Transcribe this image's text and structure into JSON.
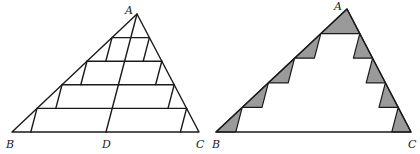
{
  "figure_left": {
    "labels": {
      "A": "A",
      "B": "B",
      "C": "C",
      "D": "D"
    },
    "vertices": {
      "A": [
        137,
        14
      ],
      "B": [
        12,
        132
      ],
      "C": [
        199,
        132
      ],
      "D": [
        106,
        132
      ]
    },
    "strip_count": 5
  },
  "figure_right": {
    "labels": {
      "A": "A",
      "B": "B",
      "C": "C"
    },
    "vertices": {
      "A": [
        347,
        9
      ],
      "B": [
        216,
        132
      ],
      "C": [
        411,
        132
      ]
    },
    "strip_count": 5,
    "shade_color": "#9a9a9a"
  }
}
